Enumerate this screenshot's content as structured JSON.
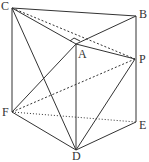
{
  "diagram": {
    "type": "geometry-prism",
    "points": {
      "C": {
        "label": "C",
        "x": 12,
        "y": 8
      },
      "B": {
        "label": "B",
        "x": 136,
        "y": 16
      },
      "A": {
        "label": "A",
        "x": 76,
        "y": 44
      },
      "P": {
        "label": "P",
        "x": 135,
        "y": 59
      },
      "F": {
        "label": "F",
        "x": 12,
        "y": 112
      },
      "E": {
        "label": "E",
        "x": 136,
        "y": 122
      },
      "D": {
        "label": "D",
        "x": 76,
        "y": 150
      }
    },
    "solid_edges": [
      [
        "C",
        "B"
      ],
      [
        "C",
        "A"
      ],
      [
        "A",
        "B"
      ],
      [
        "A",
        "P"
      ],
      [
        "C",
        "F"
      ],
      [
        "B",
        "E"
      ],
      [
        "A",
        "D"
      ],
      [
        "C",
        "D"
      ],
      [
        "F",
        "D"
      ],
      [
        "D",
        "E"
      ],
      [
        "F",
        "A"
      ],
      [
        "D",
        "P"
      ]
    ],
    "dashed_edges": [
      [
        "C",
        "P"
      ],
      [
        "F",
        "P"
      ],
      [
        "F",
        "E"
      ]
    ],
    "right_angle_at": "A",
    "line_color": "#333333"
  }
}
